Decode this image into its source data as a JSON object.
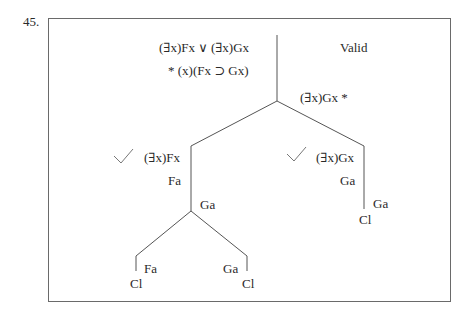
{
  "problem_number": "45.",
  "verdict": "Valid",
  "premises": [
    "(∃x)Fx ∨ (∃x)Gx",
    "* (x)(Fx ⊃ Gx)"
  ],
  "negated_conclusion": "(∃x)Gx *",
  "left_branch": {
    "check": "✓",
    "formula": "(∃x)Fx",
    "instance": "Fa",
    "split_label": "Ga",
    "sub_left": {
      "formula": "Fa",
      "close": "Cl"
    },
    "sub_right": {
      "formula": "Ga",
      "close": "Cl"
    }
  },
  "right_branch": {
    "check": "✓",
    "formula": "(∃x)Gx",
    "instance": "Ga",
    "extra": "Ga",
    "close": "Cl"
  }
}
